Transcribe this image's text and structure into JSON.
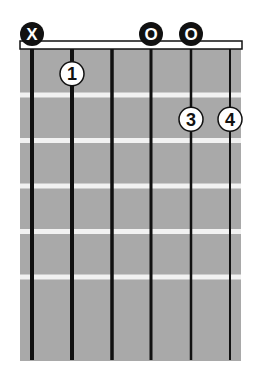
{
  "diagram": {
    "type": "guitar-chord-chart",
    "strings": 6,
    "frets_shown": 6,
    "colors": {
      "fretboard": "#a9a9a9",
      "fret": "#f2f2f2",
      "string": "#111111",
      "nut_fill": "#ffffff",
      "nut_stroke": "#111111",
      "open_muted_fill": "#111111",
      "open_muted_text": "#ffffff",
      "finger_fill": "#ffffff",
      "finger_stroke": "#111111",
      "finger_text": "#111111"
    },
    "string_markers": [
      {
        "string": 1,
        "type": "muted",
        "label": "X"
      },
      {
        "string": 4,
        "type": "open",
        "label": "O"
      },
      {
        "string": 5,
        "type": "open",
        "label": "O"
      }
    ],
    "fingers": [
      {
        "string": 2,
        "fret": 1,
        "label": "1"
      },
      {
        "string": 5,
        "fret": 2,
        "label": "3"
      },
      {
        "string": 6,
        "fret": 2,
        "label": "4"
      }
    ]
  }
}
